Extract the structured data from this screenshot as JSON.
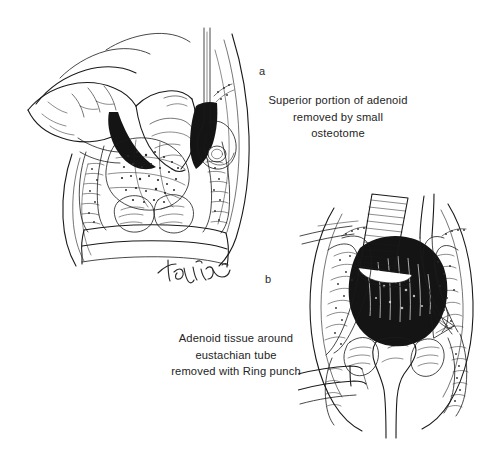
{
  "figure": {
    "kind": "medical-line-illustration",
    "background_color": "#ffffff",
    "ink_color": "#1a1a1a"
  },
  "panels": [
    {
      "id": "a",
      "label": "a",
      "caption": "Superior portion of adenoid\nremoved by small\nosteotome",
      "caption_lines": [
        "Superior portion of adenoid",
        "removed by small",
        "osteotome"
      ],
      "position": "top-left",
      "illustration_name": "adenoidectomy-osteotome-illustration"
    },
    {
      "id": "b",
      "label": "b",
      "caption": "Adenoid tissue around\neustachian tube\nremoved with Ring punch",
      "caption_lines": [
        "Adenoid tissue around",
        "eustachian tube",
        "removed with Ring punch"
      ],
      "position": "bottom-right",
      "illustration_name": "adenoidectomy-ring-punch-illustration"
    }
  ],
  "signature": {
    "text": "Taguin",
    "style": "handwritten-cursive"
  }
}
